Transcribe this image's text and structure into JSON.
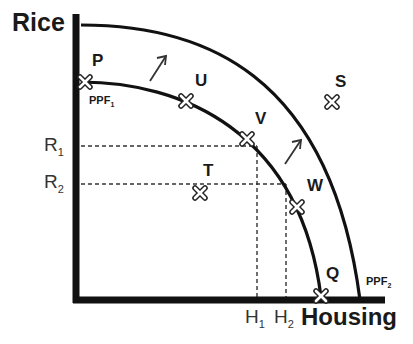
{
  "diagram": {
    "type": "production-possibility-frontier",
    "y_axis_label": "Rice",
    "x_axis_label": "Housing",
    "curves": [
      {
        "name": "PPF",
        "subscript": "1",
        "label_near": "P"
      },
      {
        "name": "PPF",
        "subscript": "2",
        "label_near": "Q"
      }
    ],
    "points": [
      {
        "label": "P",
        "on": "PPF1",
        "position": "y-axis intercept"
      },
      {
        "label": "U",
        "on": "PPF1"
      },
      {
        "label": "V",
        "on": "PPF1"
      },
      {
        "label": "W",
        "on": "PPF1"
      },
      {
        "label": "Q",
        "on": "PPF1",
        "position": "x-axis intercept"
      },
      {
        "label": "T",
        "on": "inside PPF1"
      },
      {
        "label": "S",
        "on": "outside PPF2"
      }
    ],
    "y_ticks": [
      {
        "name": "R",
        "subscript": "1"
      },
      {
        "name": "R",
        "subscript": "2"
      }
    ],
    "x_ticks": [
      {
        "name": "H",
        "subscript": "1"
      },
      {
        "name": "H",
        "subscript": "2"
      }
    ],
    "arrows": [
      "outward shift PPF1 to PPF2",
      "outward shift PPF1 to PPF2"
    ]
  }
}
